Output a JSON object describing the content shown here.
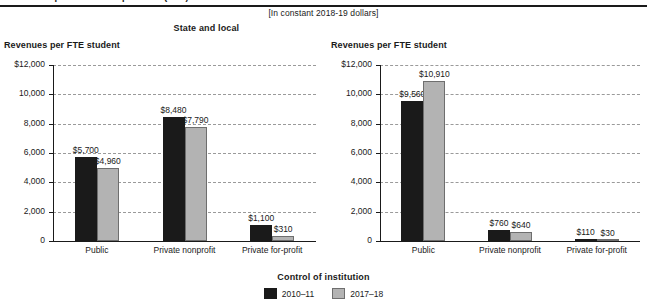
{
  "top_caption": "Revenues per full-time-equivalent (FTE) student",
  "units_note": "[In constant 2018-19 dollars]",
  "axis_title": "Revenues per FTE student",
  "category_axis_title": "Control of institution",
  "legend": {
    "title": "Control of institution",
    "entries": [
      {
        "label": "2010–11",
        "color": "#1a1a1a",
        "swatch": "dark-swatch"
      },
      {
        "label": "2017–18",
        "color": "#b3b3b3",
        "swatch": "gray-swatch"
      }
    ]
  },
  "y_ticks": [
    "$12,000",
    "10,000",
    "8,000",
    "6,000",
    "4,000",
    "2,000",
    "0"
  ],
  "chart_data": [
    {
      "type": "bar",
      "title": "Federal",
      "xlabel": "Control of institution",
      "ylabel": "Revenues per FTE student",
      "ylim": [
        0,
        12000
      ],
      "yticks": [
        0,
        2000,
        4000,
        6000,
        8000,
        10000,
        12000
      ],
      "ytick_labels": [
        "0",
        "2,000",
        "4,000",
        "6,000",
        "8,000",
        "10,000",
        "$12,000"
      ],
      "grid": true,
      "legend_position": "bottom-center",
      "categories": [
        "Public",
        "Private nonprofit",
        "Private for-profit"
      ],
      "series": [
        {
          "name": "2010–11",
          "color": "#1a1a1a",
          "values": [
            5700,
            8480,
            1100
          ],
          "labels": [
            "$5,700",
            "$8,480",
            "$1,100"
          ]
        },
        {
          "name": "2017–18",
          "color": "#b3b3b3",
          "values": [
            4960,
            7790,
            310
          ],
          "labels": [
            "$4,960",
            "$7,790",
            "$310"
          ]
        }
      ]
    },
    {
      "type": "bar",
      "title": "State and local",
      "xlabel": "Control of institution",
      "ylabel": "Revenues per FTE student",
      "ylim": [
        0,
        12000
      ],
      "yticks": [
        0,
        2000,
        4000,
        6000,
        8000,
        10000,
        12000
      ],
      "ytick_labels": [
        "0",
        "2,000",
        "4,000",
        "6,000",
        "8,000",
        "10,000",
        "$12,000"
      ],
      "grid": true,
      "legend_position": "bottom-center",
      "categories": [
        "Public",
        "Private nonprofit",
        "Private for-profit"
      ],
      "series": [
        {
          "name": "2010–11",
          "color": "#1a1a1a",
          "values": [
            9560,
            760,
            110
          ],
          "labels": [
            "$9,560",
            "$760",
            "$110"
          ]
        },
        {
          "name": "2017–18",
          "color": "#b3b3b3",
          "values": [
            10910,
            640,
            30
          ],
          "labels": [
            "$10,910",
            "$640",
            "$30"
          ]
        }
      ]
    }
  ]
}
